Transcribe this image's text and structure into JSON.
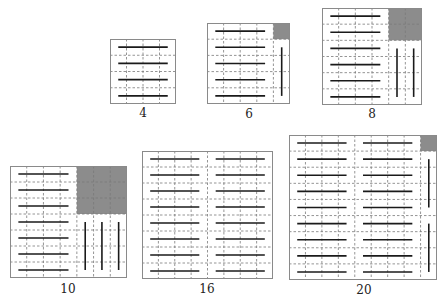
{
  "colors": {
    "border": "#8a8a8a",
    "grid": "#7a7a7a",
    "bar": "#1a1a1a",
    "block": "#8c8c8c",
    "label": "#222222"
  },
  "figures": [
    {
      "label": "4",
      "x": 110,
      "y": 39,
      "w": 66,
      "h": 65,
      "cols": 4,
      "rows": 4,
      "label_x": 143,
      "label_y": 107,
      "hbars": [
        {
          "c0": 0.5,
          "c1": 3.5,
          "rows": [
            0,
            1,
            2,
            3
          ]
        }
      ],
      "blocks": [],
      "vbars": []
    },
    {
      "label": "6",
      "x": 207,
      "y": 23,
      "w": 83,
      "h": 81,
      "cols": 5,
      "rows": 5,
      "label_x": 249,
      "label_y": 108,
      "hbars": [
        {
          "c0": 0.5,
          "c1": 3.5,
          "rows": [
            0,
            1,
            2,
            3,
            4
          ]
        }
      ],
      "blocks": [
        {
          "c": 4,
          "r": 0,
          "cw": 1,
          "rh": 1
        }
      ],
      "vbars": [
        {
          "c": 4.5,
          "r0": 1.5,
          "r1": 4.5
        }
      ]
    },
    {
      "label": "8",
      "x": 322,
      "y": 8,
      "w": 100,
      "h": 97,
      "cols": 6,
      "rows": 6,
      "label_x": 372,
      "label_y": 108,
      "hbars": [
        {
          "c0": 0.5,
          "c1": 3.5,
          "rows": [
            0,
            1,
            2,
            3,
            4,
            5
          ]
        }
      ],
      "blocks": [
        {
          "c": 4,
          "r": 0,
          "cw": 2,
          "rh": 2
        }
      ],
      "vbars": [
        {
          "c": 4.5,
          "r0": 2.5,
          "r1": 5.5
        },
        {
          "c": 5.5,
          "r0": 2.5,
          "r1": 5.5
        }
      ]
    },
    {
      "label": "10",
      "x": 10,
      "y": 166,
      "w": 117,
      "h": 112,
      "cols": 7,
      "rows": 7,
      "label_x": 68,
      "label_y": 283,
      "hbars": [
        {
          "c0": 0.5,
          "c1": 3.5,
          "rows": [
            0,
            1,
            2,
            3,
            4,
            5,
            6
          ]
        }
      ],
      "blocks": [
        {
          "c": 4,
          "r": 0,
          "cw": 3,
          "rh": 3
        }
      ],
      "vbars": [
        {
          "c": 4.5,
          "r0": 3.5,
          "r1": 6.5
        },
        {
          "c": 5.5,
          "r0": 3.5,
          "r1": 6.5
        },
        {
          "c": 6.5,
          "r0": 3.5,
          "r1": 6.5
        }
      ]
    },
    {
      "label": "16",
      "x": 142,
      "y": 151,
      "w": 131,
      "h": 128,
      "cols": 8,
      "rows": 8,
      "label_x": 207,
      "label_y": 283,
      "hbars": [
        {
          "c0": 0.5,
          "c1": 3.5,
          "rows": [
            0,
            1,
            2,
            3,
            4,
            5,
            6,
            7
          ]
        },
        {
          "c0": 4.5,
          "c1": 7.5,
          "rows": [
            0,
            1,
            2,
            3,
            4,
            5,
            6,
            7
          ]
        }
      ],
      "blocks": [],
      "vbars": []
    },
    {
      "label": "20",
      "x": 289,
      "y": 135,
      "w": 148,
      "h": 145,
      "cols": 9,
      "rows": 9,
      "label_x": 364,
      "label_y": 284,
      "hbars": [
        {
          "c0": 0.5,
          "c1": 3.5,
          "rows": [
            0,
            1,
            2,
            3,
            4,
            5,
            6,
            7,
            8
          ]
        },
        {
          "c0": 4.5,
          "c1": 7.5,
          "rows": [
            0,
            1,
            2,
            3,
            4,
            5,
            6,
            7,
            8
          ]
        }
      ],
      "blocks": [
        {
          "c": 8,
          "r": 0,
          "cw": 1,
          "rh": 1
        }
      ],
      "vbars": [
        {
          "c": 8.5,
          "r0": 1.5,
          "r1": 4.5
        },
        {
          "c": 8.5,
          "r0": 5.5,
          "r1": 8.5
        }
      ]
    }
  ]
}
